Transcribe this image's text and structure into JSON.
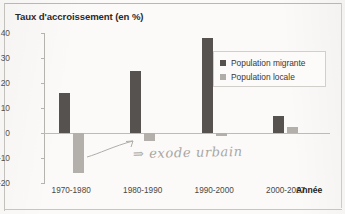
{
  "chart_data": {
    "type": "bar",
    "title": "Taux d'accroissement (en %)",
    "xlabel": "Année",
    "ylabel": "",
    "ylim": [
      -20,
      40
    ],
    "yticks": [
      40,
      30,
      20,
      10,
      0,
      -10,
      -20
    ],
    "ytick_labels": [
      "40",
      "30",
      "20",
      "10",
      "0",
      "-10",
      "-20"
    ],
    "grid": false,
    "legend_position": "upper right",
    "categories": [
      "1970-1980",
      "1980-1990",
      "1990-2000",
      "2000-2007"
    ],
    "series": [
      {
        "name": "Population migrante",
        "color": "#55524f",
        "values": [
          16,
          25,
          38,
          7
        ]
      },
      {
        "name": "Population locale",
        "color": "#b0ada8",
        "values": [
          -16,
          -3,
          -1,
          2.5
        ]
      }
    ],
    "annotations": [
      {
        "name": "exode-urbain-note",
        "text": "⇒ exode urbain",
        "style": "handwritten-pencil",
        "points_to": "Population locale 1970-1980"
      }
    ]
  },
  "legend": {
    "items": [
      {
        "label": "Population migrante",
        "swatch": "dark"
      },
      {
        "label": "Population locale",
        "swatch": "light"
      }
    ]
  }
}
